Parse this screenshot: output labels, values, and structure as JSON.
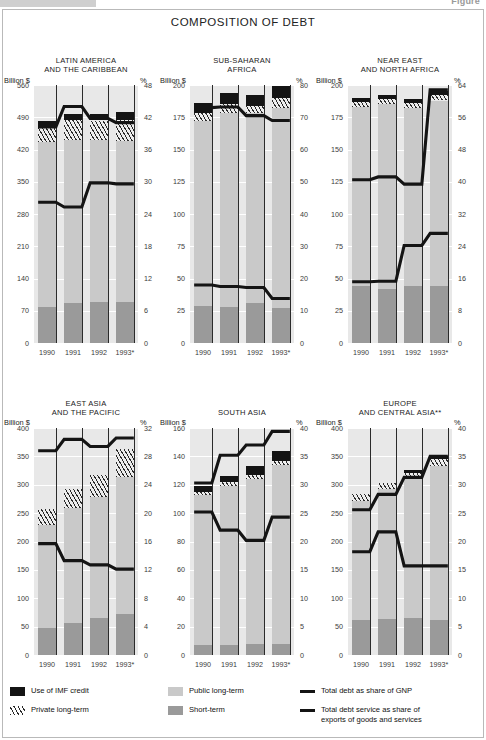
{
  "header": {
    "figure_word": "Figure",
    "title": "COMPOSITION OF DEBT"
  },
  "legend": {
    "items": [
      {
        "key": "imf",
        "label": "Use of IMF credit",
        "swatch": "solid-black-square-icon"
      },
      {
        "key": "private",
        "label": "Private long-term",
        "swatch": "hatched-square-icon"
      },
      {
        "key": "public",
        "label": "Public long-term",
        "swatch": "light-grey-square-icon"
      },
      {
        "key": "short",
        "label": "Short-term",
        "swatch": "mid-grey-square-icon"
      },
      {
        "key": "gnp",
        "label": "Total debt as share of GNP",
        "swatch": "black-line-icon"
      },
      {
        "key": "service",
        "label": "Total debt service as share of\nexports of goods and services",
        "swatch": "black-line-icon"
      }
    ]
  },
  "colors": {
    "short_term": "#9a9a9a",
    "public_long_term": "#c9c9c9",
    "private_long_term": "#ededed",
    "imf_credit": "#141414",
    "line": "#141414",
    "plot_background": "#e8e8e8",
    "grid": "#ffffff"
  },
  "axis_labels": {
    "left": "Billion $",
    "right": "%"
  },
  "chart_data": {
    "type": "bar",
    "title": "COMPOSITION OF DEBT",
    "categories": [
      "1990",
      "1991",
      "1992",
      "1993*"
    ],
    "xlabel": "",
    "ylabel": "Billion $",
    "grid": true,
    "legend_position": "bottom",
    "note": "Stacked bars on left axis (Billion $); two line series on right axis (%).",
    "panels": [
      {
        "id": "latin-america",
        "title": [
          "LATIN AMERICA",
          "AND THE CARIBBEAN"
        ],
        "ylabel": "Billion $",
        "y2label": "%",
        "ylim": [
          0,
          560
        ],
        "yticks": [
          0,
          70,
          140,
          210,
          280,
          350,
          420,
          490,
          560
        ],
        "y2lim": [
          0,
          48
        ],
        "y2ticks": [
          0,
          6,
          12,
          18,
          24,
          30,
          36,
          42,
          48
        ],
        "series": [
          {
            "name": "Short-term",
            "values": [
              78,
              86,
              90,
              89
            ]
          },
          {
            "name": "Public long-term",
            "values": [
              359,
              355,
              350,
              350
            ]
          },
          {
            "name": "Private long-term",
            "values": [
              30,
              42,
              43,
              46
            ]
          },
          {
            "name": "Use of IMF credit",
            "values": [
              14,
              14,
              14,
              16
            ]
          }
        ],
        "totals": [
          481,
          497,
          497,
          501
        ],
        "lines": [
          {
            "name": "Total debt as share of GNP",
            "values": [
              40.2,
              44.0,
              41.8,
              41.0
            ]
          },
          {
            "name": "Total debt service as share of exports of goods and services",
            "values": [
              26.2,
              25.3,
              29.8,
              29.6
            ]
          }
        ]
      },
      {
        "id": "sub-saharan-africa",
        "title": [
          "SUB-SAHARAN",
          "AFRICA"
        ],
        "ylabel": "Billion $",
        "y2label": "%",
        "ylim": [
          0,
          200
        ],
        "yticks": [
          0,
          25,
          50,
          75,
          100,
          125,
          150,
          175,
          200
        ],
        "y2lim": [
          0,
          80
        ],
        "y2ticks": [
          0,
          10,
          20,
          30,
          40,
          50,
          60,
          70,
          80
        ],
        "series": [
          {
            "name": "Short-term",
            "values": [
              29,
              28,
              31,
              27
            ]
          },
          {
            "name": "Public long-term",
            "values": [
              143,
              150,
              147,
              155
            ]
          },
          {
            "name": "Private long-term",
            "values": [
              6,
              7,
              6,
              8
            ]
          },
          {
            "name": "Use of IMF credit",
            "values": [
              8,
              9,
              8,
              9
            ]
          }
        ],
        "totals": [
          186,
          194,
          192,
          199
        ],
        "lines": [
          {
            "name": "Total debt as share of GNP",
            "values": [
              73.0,
              73.2,
              70.5,
              69.0
            ]
          },
          {
            "name": "Total debt service as share of exports of goods and services",
            "values": [
              18.0,
              17.5,
              17.2,
              13.8
            ]
          }
        ]
      },
      {
        "id": "near-east-north-africa",
        "title": [
          "NEAR EAST",
          "AND NORTH AFRICA"
        ],
        "ylabel": "Billion $",
        "y2label": "%",
        "ylim": [
          0,
          200
        ],
        "yticks": [
          0,
          25,
          50,
          75,
          100,
          125,
          150,
          175,
          200
        ],
        "y2lim": [
          0,
          64
        ],
        "y2ticks": [
          0,
          8,
          16,
          24,
          32,
          40,
          48,
          56,
          64
        ],
        "series": [
          {
            "name": "Short-term",
            "values": [
              44,
              42,
              44,
              44
            ]
          },
          {
            "name": "Public long-term",
            "values": [
              139,
              143,
              138,
              144
            ]
          },
          {
            "name": "Private long-term",
            "values": [
              4,
              4,
              4,
              4
            ]
          },
          {
            "name": "Use of IMF credit",
            "values": [
              3,
              3,
              3,
              3
            ]
          }
        ],
        "totals": [
          190,
          192,
          189,
          195
        ],
        "lines": [
          {
            "name": "Total debt as share of GNP",
            "values": [
              40.5,
              41.2,
              39.4,
              62.8
            ]
          },
          {
            "name": "Total debt service as share of exports of goods and services",
            "values": [
              15.2,
              15.3,
              24.2,
              27.2
            ]
          }
        ]
      },
      {
        "id": "east-asia-pacific",
        "title": [
          "EAST ASIA",
          "AND THE PACIFIC"
        ],
        "ylabel": "Billion $",
        "y2label": "%",
        "ylim": [
          0,
          400
        ],
        "yticks": [
          0,
          50,
          100,
          150,
          200,
          250,
          300,
          350,
          400
        ],
        "y2lim": [
          0,
          32
        ],
        "y2ticks": [
          0,
          4,
          8,
          12,
          16,
          20,
          24,
          28,
          32
        ],
        "series": [
          {
            "name": "Short-term",
            "values": [
              47,
              56,
              66,
              72
            ]
          },
          {
            "name": "Public long-term",
            "values": [
              182,
              203,
              212,
              242
            ]
          },
          {
            "name": "Private long-term",
            "values": [
              28,
              33,
              40,
              49
            ]
          },
          {
            "name": "Use of IMF credit",
            "values": [
              0,
              0,
              0,
              0
            ]
          }
        ],
        "totals": [
          257,
          292,
          318,
          363
        ],
        "lines": [
          {
            "name": "Total debt as share of GNP",
            "values": [
              28.8,
              30.4,
              29.4,
              30.6
            ]
          },
          {
            "name": "Total debt service as share of exports of goods and services",
            "values": [
              15.7,
              13.3,
              12.7,
              12.1
            ]
          }
        ]
      },
      {
        "id": "south-asia",
        "title": [
          "SOUTH ASIA"
        ],
        "ylabel": "Billion $",
        "y2label": "%",
        "ylim": [
          0,
          160
        ],
        "yticks": [
          0,
          20,
          40,
          60,
          80,
          100,
          120,
          140,
          160
        ],
        "y2lim": [
          0,
          40
        ],
        "y2ticks": [
          0,
          5,
          10,
          15,
          20,
          25,
          30,
          35,
          40
        ],
        "series": [
          {
            "name": "Short-term",
            "values": [
              7,
              7,
              8,
              8
            ]
          },
          {
            "name": "Public long-term",
            "values": [
              106,
              112,
              116,
              126
            ]
          },
          {
            "name": "Private long-term",
            "values": [
              2,
              3,
              3,
              3
            ]
          },
          {
            "name": "Use of IMF credit",
            "values": [
              4,
              4,
              6,
              7
            ]
          }
        ],
        "totals": [
          119,
          126,
          133,
          144
        ],
        "lines": [
          {
            "name": "Total debt as share of GNP",
            "values": [
              30.3,
              35.2,
              37.0,
              39.4
            ]
          },
          {
            "name": "Total debt service as share of exports of goods and services",
            "values": [
              25.2,
              22.0,
              20.2,
              24.3
            ]
          }
        ]
      },
      {
        "id": "europe-central-asia",
        "title": [
          "EUROPE",
          "AND CENTRAL ASIA**"
        ],
        "ylabel": "Billion $",
        "y2label": "%",
        "ylim": [
          0,
          400
        ],
        "yticks": [
          0,
          50,
          100,
          150,
          200,
          250,
          300,
          350,
          400
        ],
        "y2lim": [
          0,
          40
        ],
        "y2ticks": [
          0,
          5,
          10,
          15,
          20,
          25,
          30,
          35,
          40
        ],
        "series": [
          {
            "name": "Short-term",
            "values": [
              62,
              63,
              65,
              62
            ]
          },
          {
            "name": "Public long-term",
            "values": [
              209,
              229,
              246,
              271
            ]
          },
          {
            "name": "Private long-term",
            "values": [
              12,
              11,
              10,
              12
            ]
          },
          {
            "name": "Use of IMF credit",
            "values": [
              0,
              0,
              5,
              6
            ]
          }
        ],
        "totals": [
          283,
          303,
          326,
          351
        ],
        "lines": [
          {
            "name": "Total debt as share of GNP",
            "values": [
              25.6,
              28.3,
              31.3,
              35.0
            ]
          },
          {
            "name": "Total debt service as share of exports of goods and services",
            "values": [
              18.2,
              21.7,
              15.7,
              15.7
            ]
          }
        ]
      }
    ]
  }
}
